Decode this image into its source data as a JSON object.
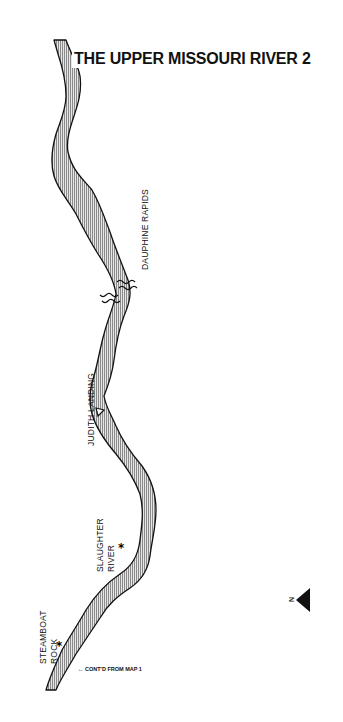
{
  "map": {
    "title": "THE UPPER MISSOURI RIVER  2",
    "labels": {
      "dauphine_rapids": "DAUPHINE RAPIDS",
      "judith_landing": "JUDITH LANDING",
      "slaughter_river_line1": "SLAUGHTER",
      "slaughter_river_line2": "RIVER",
      "steamboat_rock_line1": "STEAMBOAT",
      "steamboat_rock_line2": "ROCK",
      "continued": "← CONT'D FROM MAP 1"
    },
    "north_arrow": {
      "letter": "N",
      "direction": "left"
    },
    "colors": {
      "river_fill": "#bdbdbd",
      "river_outline": "#111111",
      "background": "#ffffff"
    }
  }
}
